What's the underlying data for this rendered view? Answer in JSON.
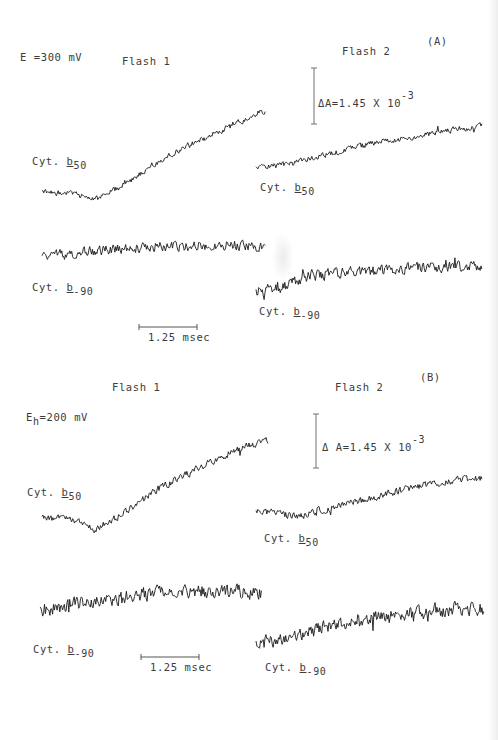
{
  "panels": [
    {
      "id": "A",
      "panel_label": "(A)",
      "potential_label": "E =300 mV",
      "flash1_title": "Flash 1",
      "flash2_title": "Flash 2",
      "absorbance_scale": {
        "prefix": "ΔA=1.45 X 10",
        "exponent": "-3"
      },
      "time_scale": "1.25 msec",
      "trace_labels": {
        "f1_b50": {
          "base": "Cyt.",
          "letter": "b",
          "sub": "50"
        },
        "f2_b50": {
          "base": "Cyt.",
          "letter": "b",
          "sub": "50"
        },
        "f1_b90": {
          "base": "Cyt.",
          "letter": "b",
          "sub": "-90"
        },
        "f2_b90": {
          "base": "Cyt.",
          "letter": "b",
          "sub": "-90"
        }
      }
    },
    {
      "id": "B",
      "panel_label": "(B)",
      "potential_label": {
        "base": "E",
        "sub": "h",
        "rest": "=200 mV"
      },
      "flash1_title": "Flash 1",
      "flash2_title": "Flash 2",
      "absorbance_scale": {
        "prefix": "Δ A=1.45 X 10",
        "exponent": "-3"
      },
      "time_scale": "1.25 msec",
      "trace_labels": {
        "f1_b50": {
          "base": "Cyt.",
          "letter": "b",
          "sub": "50"
        },
        "f2_b50": {
          "base": "Cyt.",
          "letter": "b",
          "sub": "50"
        },
        "f1_b90": {
          "base": "Cyt.",
          "letter": "b",
          "sub": "-90"
        },
        "f2_b90": {
          "base": "Cyt.",
          "letter": "b",
          "sub": "-90"
        }
      }
    }
  ],
  "chart_data": {
    "type": "line",
    "xlabel": "time (scale bar 1.25 msec)",
    "ylabel": "ΔA (scale bar 1.45 x 10^-3)",
    "note": "Traces are drawn in pixel coordinates; shape control points [x,y] estimated from image; fine noise texture is synthetic (seeded generator), not read from the image.",
    "scale_bars": {
      "A": {
        "absorbance": {
          "x": 314,
          "y1": 68,
          "y2": 124
        },
        "time": {
          "x1": 139,
          "x2": 197,
          "y": 327
        }
      },
      "B": {
        "absorbance": {
          "x": 316,
          "y1": 414,
          "y2": 468
        },
        "time": {
          "x1": 141,
          "x2": 199,
          "y": 657
        }
      }
    },
    "series": [
      {
        "name": "A Flash 1 Cyt.b50",
        "points": [
          [
            42,
            192
          ],
          [
            75,
            194
          ],
          [
            95,
            200
          ],
          [
            125,
            184
          ],
          [
            160,
            160
          ],
          [
            200,
            140
          ],
          [
            235,
            124
          ],
          [
            266,
            110
          ]
        ],
        "noise": 4,
        "seed": 11
      },
      {
        "name": "A Flash 2 Cyt.b50",
        "points": [
          [
            256,
            168
          ],
          [
            290,
            164
          ],
          [
            330,
            154
          ],
          [
            370,
            144
          ],
          [
            410,
            138
          ],
          [
            450,
            130
          ],
          [
            482,
            126
          ]
        ],
        "noise": 4,
        "seed": 23
      },
      {
        "name": "A Flash 1 Cyt.b-90",
        "points": [
          [
            42,
            258
          ],
          [
            80,
            252
          ],
          [
            130,
            248
          ],
          [
            180,
            246
          ],
          [
            230,
            245
          ],
          [
            266,
            248
          ]
        ],
        "noise": 7,
        "seed": 37
      },
      {
        "name": "A Flash 2 Cyt.b-90",
        "points": [
          [
            256,
            292
          ],
          [
            290,
            285
          ],
          [
            310,
            275
          ],
          [
            360,
            272
          ],
          [
            420,
            268
          ],
          [
            482,
            265
          ]
        ],
        "noise": 8,
        "seed": 41
      },
      {
        "name": "B Flash 1 Cyt.b50",
        "points": [
          [
            42,
            518
          ],
          [
            75,
            520
          ],
          [
            95,
            530
          ],
          [
            125,
            512
          ],
          [
            160,
            488
          ],
          [
            200,
            468
          ],
          [
            235,
            450
          ],
          [
            268,
            440
          ]
        ],
        "noise": 5,
        "seed": 53
      },
      {
        "name": "B Flash 2 Cyt.b50",
        "points": [
          [
            256,
            512
          ],
          [
            300,
            516
          ],
          [
            340,
            505
          ],
          [
            380,
            496
          ],
          [
            420,
            486
          ],
          [
            460,
            480
          ],
          [
            482,
            478
          ]
        ],
        "noise": 5,
        "seed": 67
      },
      {
        "name": "B Flash 1 Cyt.b-90",
        "points": [
          [
            40,
            610
          ],
          [
            80,
            604
          ],
          [
            130,
            596
          ],
          [
            180,
            590
          ],
          [
            230,
            592
          ],
          [
            262,
            592
          ]
        ],
        "noise": 10,
        "seed": 71
      },
      {
        "name": "B Flash 2 Cyt.b-90",
        "points": [
          [
            256,
            644
          ],
          [
            300,
            635
          ],
          [
            350,
            620
          ],
          [
            400,
            615
          ],
          [
            440,
            610
          ],
          [
            484,
            608
          ]
        ],
        "noise": 10,
        "seed": 89
      }
    ]
  }
}
